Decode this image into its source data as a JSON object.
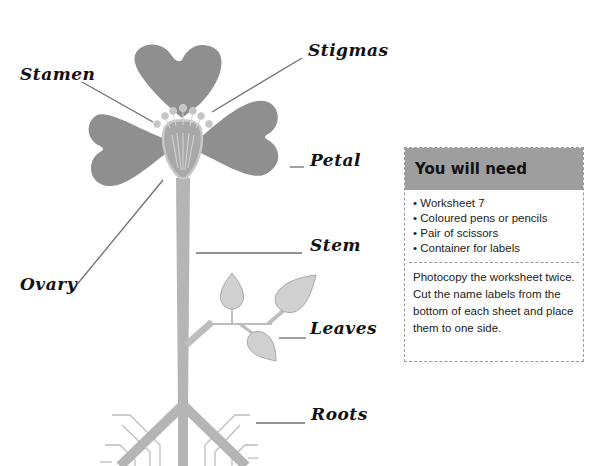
{
  "labels": {
    "stamen": "Stamen",
    "stigmas": "Stigmas",
    "petal": "Petal",
    "stem": "Stem",
    "ovary": "Ovary",
    "leaves": "Leaves",
    "roots": "Roots"
  },
  "panel": {
    "title": "You will need",
    "items": [
      "Worksheet 7",
      "Coloured pens or pencils",
      "Pair of scissors",
      "Container for labels"
    ],
    "note": "Photocopy the worksheet twice. Cut the name labels from the bottom of each sheet and place them to one side."
  },
  "colors": {
    "petal": "#8f8f8f",
    "stem": "#b5b5b5",
    "leaf": "#d0d0d0",
    "line": "#6e6e6e",
    "panel_header": "#9e9e9e"
  }
}
